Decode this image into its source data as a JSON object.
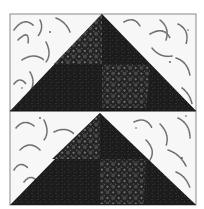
{
  "image": {
    "subject": "Flying Geese quilt block",
    "description": "Two stacked dark triangles (geese) on a white background printed with gray dotted arcs; each goose contains two lattice-patterned dark patches."
  },
  "block": {
    "x": 10,
    "y": 14,
    "width": 186,
    "height": 191,
    "border_color": "#8a8a8a"
  },
  "colors": {
    "background_fabric": "#f7f7f7",
    "arc_print": "#6e6e6e",
    "goose_dark": "#1c1c1c",
    "goose_mottle": "#2b2b2b",
    "lattice_dark": "#202020",
    "lattice_dots": "#8c8c8c"
  },
  "geese": [
    {
      "name": "top-goose",
      "apex": [
        102,
        14
      ],
      "base_left": [
        10,
        111
      ],
      "base_right": [
        196,
        111
      ],
      "mid_y": 64
    },
    {
      "name": "bottom-goose",
      "apex": [
        100,
        113
      ],
      "base_left": [
        10,
        205
      ],
      "base_right": [
        196,
        205
      ],
      "mid_y": 159
    }
  ]
}
